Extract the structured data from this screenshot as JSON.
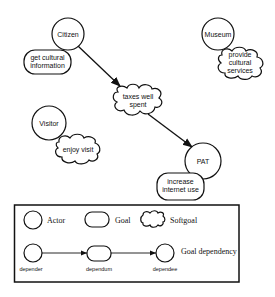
{
  "diagram": {
    "actors": [
      {
        "id": "citizen",
        "label": "Citizen"
      },
      {
        "id": "museum",
        "label": "Museum"
      },
      {
        "id": "visitor",
        "label": "Visitor"
      },
      {
        "id": "pat",
        "label": "PAT"
      }
    ],
    "goals": [
      {
        "id": "get-cultural-information",
        "lines": [
          "get cultural",
          "information"
        ],
        "owner": "citizen"
      },
      {
        "id": "increase-internet-use",
        "lines": [
          "increase",
          "internet use"
        ],
        "owner": "pat"
      }
    ],
    "softgoals": [
      {
        "id": "taxes-well-spent",
        "lines": [
          "taxes well",
          "spent"
        ]
      },
      {
        "id": "provide-cultural-services",
        "lines": [
          "provide",
          "cultural",
          "services"
        ],
        "owner": "museum"
      },
      {
        "id": "enjoy-visit",
        "lines": [
          "enjoy visit"
        ],
        "owner": "visitor"
      }
    ],
    "dependencies": [
      {
        "from": "citizen",
        "dependum": "taxes-well-spent",
        "to": "pat"
      }
    ]
  },
  "legend": {
    "actor": "Actor",
    "goal": "Goal",
    "softgoal": "Softgoal",
    "goal_dependency": "Goal dependency",
    "depender": "depender",
    "dependum": "dependum",
    "dependee": "dependee"
  }
}
